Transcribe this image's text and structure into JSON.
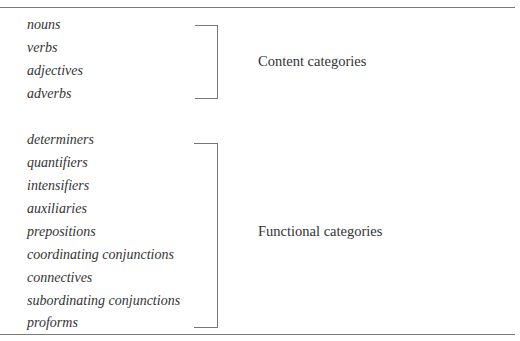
{
  "table": {
    "groups": [
      {
        "label": "Content categories",
        "items": [
          "nouns",
          "verbs",
          "adjectives",
          "adverbs"
        ]
      },
      {
        "label": "Functional categories",
        "items": [
          "determiners",
          "quantifiers",
          "intensifiers",
          "auxiliaries",
          "prepositions",
          "coordinating conjunctions",
          "connectives",
          "subordinating conjunctions",
          "proforms"
        ]
      }
    ]
  }
}
